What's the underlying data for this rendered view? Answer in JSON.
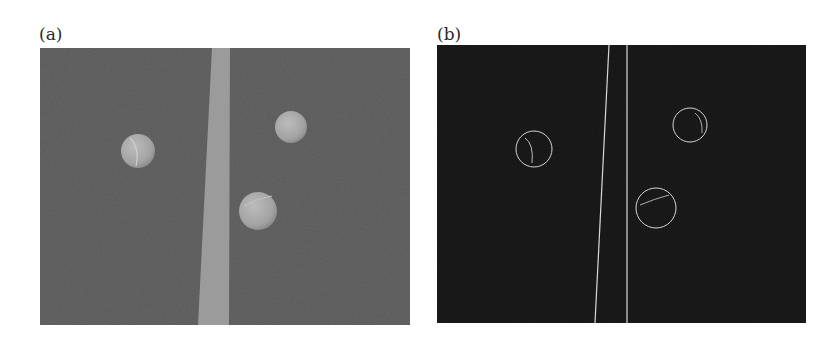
{
  "figure": {
    "panel_a": {
      "label": "(a)",
      "description": "Grayscale photo of three tennis balls on a court surface with a light court line",
      "background_color": "#5a5a5a",
      "line_color": "#9a9a9a",
      "ball_color": "#a9a9a9",
      "balls": [
        {
          "cx": 98,
          "cy": 103,
          "r": 17
        },
        {
          "cx": 251,
          "cy": 79,
          "r": 16
        },
        {
          "cx": 218,
          "cy": 163,
          "r": 19
        }
      ]
    },
    "panel_b": {
      "label": "(b)",
      "description": "Edge-detection output showing circle outlines and court line edges on black background",
      "background_color": "#141414",
      "edge_color": "#d8d8d8",
      "circles": [
        {
          "cx": 97,
          "cy": 104,
          "r": 18
        },
        {
          "cx": 253,
          "cy": 80,
          "r": 17
        },
        {
          "cx": 219,
          "cy": 163,
          "r": 20
        }
      ]
    }
  }
}
